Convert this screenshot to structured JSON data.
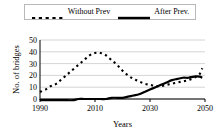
{
  "legend": {
    "entries": [
      {
        "label": "Without Prev",
        "style": "dashed",
        "key_name": "legend-key-dashed"
      },
      {
        "label": "After Prev.",
        "style": "solid",
        "key_name": "legend-key-solid"
      }
    ]
  },
  "colors": {
    "line": "#000000",
    "grid": "#c9c9c9",
    "axis": "#000000",
    "background": "#ffffff",
    "legend_border": "#b9b9b9"
  },
  "chart_data": {
    "type": "line",
    "title": "",
    "xlabel": "Years",
    "ylabel": "No. of bridges",
    "xlim": [
      1990,
      2050
    ],
    "ylim": [
      0,
      50
    ],
    "grid": true,
    "legend_position": "top",
    "xticks": [
      1990,
      2010,
      2030,
      2050
    ],
    "yticks": [
      0,
      10,
      20,
      30,
      40,
      50
    ],
    "x": [
      1990,
      1992,
      1994,
      1996,
      1998,
      2000,
      2002,
      2004,
      2006,
      2008,
      2010,
      2012,
      2014,
      2016,
      2018,
      2020,
      2022,
      2024,
      2026,
      2028,
      2030,
      2032,
      2034,
      2036,
      2038,
      2040,
      2042,
      2044,
      2046,
      2048,
      2049
    ],
    "series": [
      {
        "name": "Without Prev",
        "style": "dashed",
        "values": [
          6,
          8,
          11,
          13,
          17,
          21,
          25,
          29,
          33,
          37,
          39,
          39,
          37,
          33,
          29,
          24,
          20,
          17,
          15,
          13,
          12,
          11,
          11,
          12,
          13,
          14,
          15,
          16,
          18,
          21,
          26
        ]
      },
      {
        "name": "After Prev.",
        "style": "solid",
        "values": [
          -1,
          -1,
          -1,
          -1,
          -1,
          -1,
          -1,
          0,
          0,
          0,
          0,
          0,
          0,
          1,
          1,
          1,
          2,
          3,
          4,
          6,
          8,
          10,
          12,
          14,
          16,
          17,
          18,
          18,
          19,
          19,
          18
        ]
      }
    ]
  }
}
